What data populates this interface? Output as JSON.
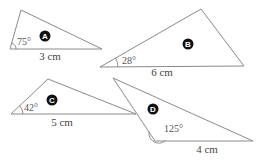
{
  "triangles": {
    "A": {
      "badge": "A",
      "side_label": "3 cm",
      "angle_label": "75°"
    },
    "B": {
      "badge": "B",
      "side_label": "6 cm",
      "angle_label": "28°"
    },
    "C": {
      "badge": "C",
      "side_label": "5 cm",
      "angle_label": "42°"
    },
    "D": {
      "badge": "D",
      "side_label": "4 cm",
      "angle_label": "125°"
    }
  }
}
